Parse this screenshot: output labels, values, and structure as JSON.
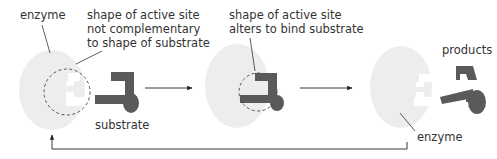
{
  "colors": {
    "enzyme": "#ededed",
    "substrate": "#5a5a5a",
    "line": "#333333",
    "dashed": "#555555",
    "background": "#ffffff"
  },
  "stage1": {
    "enzyme_label": "enzyme",
    "active_site_label_line1": "shape of active site",
    "active_site_label_line2": "not complementary",
    "active_site_label_line3": "to shape of substrate",
    "substrate_label": "substrate"
  },
  "stage2": {
    "active_site_label_line1": "shape of active site",
    "active_site_label_line2": "alters to bind substrate"
  },
  "stage3": {
    "products_label": "products",
    "enzyme_label": "enzyme"
  }
}
